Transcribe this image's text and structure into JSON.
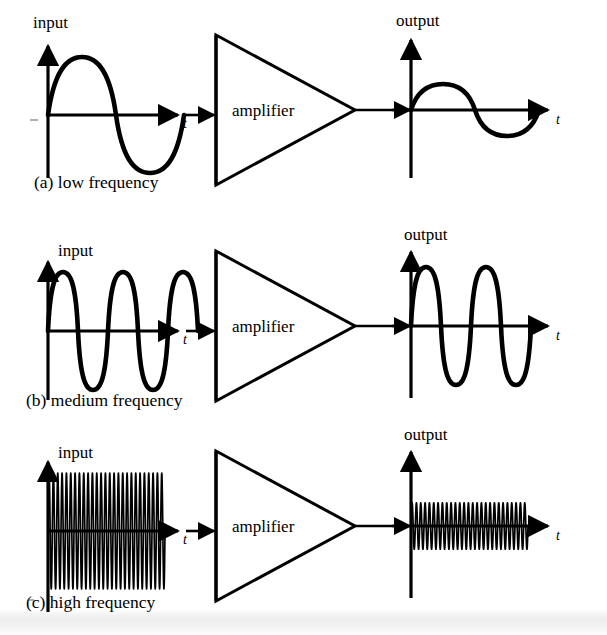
{
  "figure": {
    "amplifier_label": "amplifier",
    "input_label": "input",
    "output_label": "output",
    "time_axis_label": "t"
  },
  "rows": [
    {
      "id": "row-a",
      "caption": "(a) low frequency",
      "input_label": "input",
      "output_label": "output",
      "amplifier_label": "amplifier",
      "time_axis_label": "t",
      "input_cycles": 1,
      "output_cycles": 1,
      "input_amplitude": 1.0,
      "output_amplitude": 0.45,
      "stroke": "thick"
    },
    {
      "id": "row-b",
      "caption": "(b) medium frequency",
      "input_label": "input",
      "output_label": "output",
      "amplifier_label": "amplifier",
      "time_axis_label": "t",
      "input_cycles": 4,
      "output_cycles": 4,
      "input_amplitude": 1.0,
      "output_amplitude": 1.0,
      "stroke": "thick"
    },
    {
      "id": "row-c",
      "caption": "(c) high frequency",
      "input_label": "input",
      "output_label": "output",
      "amplifier_label": "amplifier",
      "time_axis_label": "t",
      "input_cycles": 27,
      "output_cycles": 27,
      "input_amplitude": 1.0,
      "output_amplitude": 0.4,
      "stroke": "thin"
    }
  ],
  "chart_data": {
    "type": "line",
    "xlabel": "t",
    "ylabel": "",
    "grid": false,
    "legend": null,
    "panels": [
      {
        "row": "(a) low frequency",
        "signal": "input",
        "waveform": "sine",
        "cycles": 1,
        "amplitude": 1.0
      },
      {
        "row": "(a) low frequency",
        "signal": "output",
        "waveform": "sine",
        "cycles": 1,
        "amplitude": 0.45
      },
      {
        "row": "(b) medium frequency",
        "signal": "input",
        "waveform": "sine",
        "cycles": 4,
        "amplitude": 1.0
      },
      {
        "row": "(b) medium frequency",
        "signal": "output",
        "waveform": "sine",
        "cycles": 4,
        "amplitude": 1.0
      },
      {
        "row": "(c) high frequency",
        "signal": "input",
        "waveform": "sine",
        "cycles": 27,
        "amplitude": 1.0
      },
      {
        "row": "(c) high frequency",
        "signal": "output",
        "waveform": "sine",
        "cycles": 27,
        "amplitude": 0.4
      }
    ]
  },
  "colors": {
    "ink": "#000000",
    "paper": "#ffffff"
  }
}
